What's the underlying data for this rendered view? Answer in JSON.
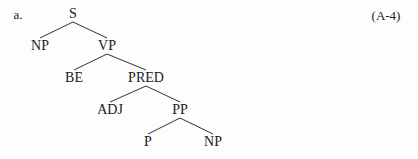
{
  "example_label": "a.",
  "equation_number": "(A-4)",
  "tree": {
    "nodes": [
      {
        "id": "S",
        "label": "S",
        "x": 73,
        "y": 14
      },
      {
        "id": "NP1",
        "label": "NP",
        "x": 40,
        "y": 46
      },
      {
        "id": "VP",
        "label": "VP",
        "x": 107,
        "y": 46
      },
      {
        "id": "BE",
        "label": "BE",
        "x": 74,
        "y": 78
      },
      {
        "id": "PRED",
        "label": "PRED",
        "x": 146,
        "y": 78
      },
      {
        "id": "ADJ",
        "label": "ADJ",
        "x": 110,
        "y": 110
      },
      {
        "id": "PP",
        "label": "PP",
        "x": 180,
        "y": 110
      },
      {
        "id": "P",
        "label": "P",
        "x": 148,
        "y": 142
      },
      {
        "id": "NP2",
        "label": "NP",
        "x": 213,
        "y": 142
      }
    ],
    "edges": [
      [
        "S",
        "NP1"
      ],
      [
        "S",
        "VP"
      ],
      [
        "VP",
        "BE"
      ],
      [
        "VP",
        "PRED"
      ],
      [
        "PRED",
        "ADJ"
      ],
      [
        "PRED",
        "PP"
      ],
      [
        "PP",
        "P"
      ],
      [
        "PP",
        "NP2"
      ]
    ]
  }
}
